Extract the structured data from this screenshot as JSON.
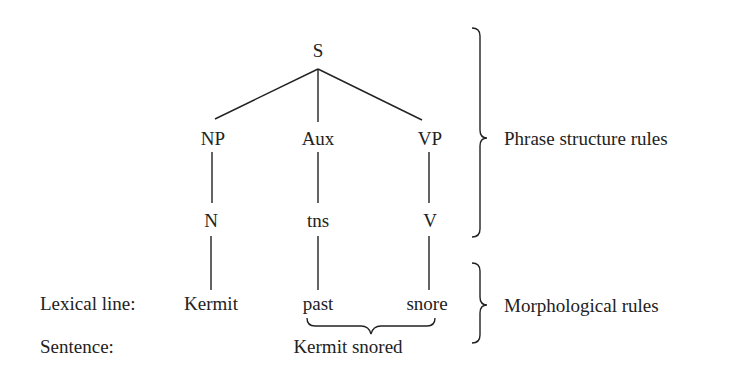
{
  "tree": {
    "root": "S",
    "level1": [
      "NP",
      "Aux",
      "VP"
    ],
    "level2": [
      "N",
      "tns",
      "V"
    ],
    "lexical": [
      "Kermit",
      "past",
      "snore"
    ]
  },
  "rows": {
    "lexical_label": "Lexical line:",
    "sentence_label": "Sentence:",
    "sentence": "Kermit snored"
  },
  "braces": {
    "phrase": "Phrase structure rules",
    "morph": "Morphological rules"
  },
  "colors": {
    "ink": "#222222",
    "background": "#ffffff"
  }
}
